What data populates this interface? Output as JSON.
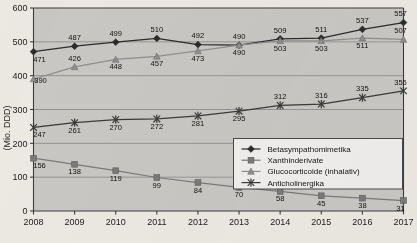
{
  "chart_data": {
    "type": "line",
    "title": "",
    "xlabel": "",
    "ylabel": "(Mio. DDD)",
    "ylim": [
      0,
      600
    ],
    "ytick_step": 100,
    "yticks": [
      "0",
      "100",
      "200",
      "300",
      "400",
      "500",
      "600"
    ],
    "grid": true,
    "legend_position": "inside-right-middle",
    "categories": [
      "2008",
      "2009",
      "2010",
      "2011",
      "2012",
      "2013",
      "2014",
      "2015",
      "2016",
      "2017"
    ],
    "series": [
      {
        "name": "Betasympathomimetika",
        "marker": "diamond",
        "color": "#2b2b2b",
        "values": [
          471,
          487,
          499,
          510,
          492,
          490,
          509,
          511,
          537,
          557
        ],
        "label_offsets": [
          "below",
          "above",
          "above",
          "above",
          "above",
          "above",
          "above",
          "above",
          "above",
          "above"
        ]
      },
      {
        "name": "Xanthinderivate",
        "marker": "square",
        "color": "#7a7a7a",
        "values": [
          156,
          138,
          119,
          99,
          84,
          70,
          58,
          45,
          38,
          31
        ],
        "label_offsets": [
          "below",
          "below",
          "below",
          "below",
          "below",
          "below",
          "below",
          "below",
          "below",
          "below"
        ]
      },
      {
        "name": "Glucocorticoide (inhalativ)",
        "marker": "triangle",
        "color": "#8f8f8f",
        "values": [
          390,
          426,
          448,
          457,
          473,
          490,
          503,
          503,
          511,
          507
        ],
        "label_offsets": [
          "right",
          "above",
          "below",
          "below",
          "below",
          "below",
          "below",
          "below",
          "below",
          "above"
        ]
      },
      {
        "name": "Anticholinergika",
        "marker": "star",
        "color": "#3a3a3a",
        "values": [
          247,
          261,
          270,
          272,
          281,
          295,
          312,
          316,
          335,
          355
        ],
        "label_offsets": [
          "below",
          "below",
          "below",
          "below",
          "below",
          "below",
          "above",
          "above",
          "above",
          "above"
        ]
      }
    ]
  },
  "legend": {
    "entries": [
      "Betasympathomimetika",
      "Xanthinderivate",
      "Glucocorticoide (inhalativ)",
      "Anticholinergika"
    ]
  },
  "colors": {
    "plot_background": "#c9c7c4",
    "page_background": "#ece9e3",
    "axis": "#3c3c3c",
    "grid": "#8e8e8e"
  }
}
